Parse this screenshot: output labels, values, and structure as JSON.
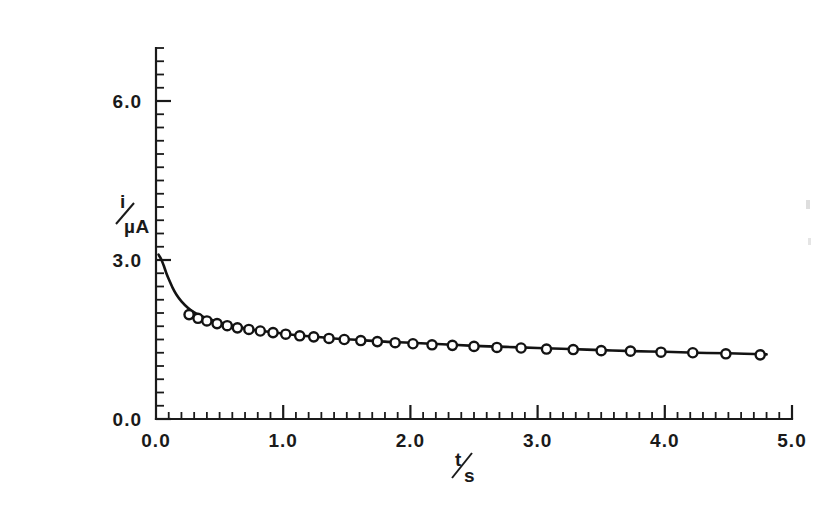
{
  "chart_data": {
    "type": "line",
    "title": "",
    "subtitle": "",
    "xlabel": "t/s",
    "ylabel": "i/µA",
    "xlim": [
      0.0,
      5.0
    ],
    "ylim": [
      0.0,
      7.0
    ],
    "grid": false,
    "legend_position": "none",
    "x_tick_labels": [
      "0.0",
      "1.0",
      "2.0",
      "3.0",
      "4.0",
      "5.0"
    ],
    "x_tick_values": [
      0.0,
      1.0,
      2.0,
      3.0,
      4.0,
      5.0
    ],
    "x_minor_tick_interval": 0.1,
    "y_tick_labels": [
      "0.0",
      "3.0",
      "6.0"
    ],
    "y_tick_values": [
      0.0,
      3.0,
      6.0
    ],
    "y_minor_tick_interval": 0.25,
    "series": [
      {
        "name": "theoretical-curve",
        "style": "solid-line",
        "x": [
          0.02,
          0.04,
          0.06,
          0.08,
          0.1,
          0.13,
          0.16,
          0.2,
          0.25,
          0.3,
          0.35,
          0.4,
          0.5,
          0.6,
          0.7,
          0.8,
          0.9,
          1.0,
          1.2,
          1.4,
          1.6,
          1.8,
          2.0,
          2.25,
          2.5,
          2.75,
          3.0,
          3.25,
          3.5,
          3.75,
          4.0,
          4.25,
          4.5,
          4.8
        ],
        "y": [
          3.1,
          3.02,
          2.9,
          2.76,
          2.64,
          2.48,
          2.35,
          2.22,
          2.1,
          2.01,
          1.95,
          1.9,
          1.82,
          1.76,
          1.71,
          1.67,
          1.64,
          1.61,
          1.56,
          1.52,
          1.49,
          1.46,
          1.44,
          1.41,
          1.38,
          1.36,
          1.34,
          1.32,
          1.3,
          1.28,
          1.27,
          1.25,
          1.24,
          1.22
        ]
      },
      {
        "name": "experimental-points",
        "style": "open-circles",
        "x": [
          0.26,
          0.33,
          0.4,
          0.48,
          0.56,
          0.64,
          0.73,
          0.82,
          0.92,
          1.02,
          1.13,
          1.24,
          1.36,
          1.48,
          1.61,
          1.74,
          1.88,
          2.02,
          2.17,
          2.33,
          2.5,
          2.68,
          2.87,
          3.07,
          3.28,
          3.5,
          3.73,
          3.97,
          4.22,
          4.48,
          4.75
        ],
        "y": [
          1.97,
          1.9,
          1.85,
          1.8,
          1.76,
          1.72,
          1.69,
          1.66,
          1.63,
          1.6,
          1.57,
          1.55,
          1.52,
          1.5,
          1.48,
          1.46,
          1.44,
          1.42,
          1.4,
          1.39,
          1.37,
          1.35,
          1.34,
          1.32,
          1.31,
          1.29,
          1.28,
          1.26,
          1.25,
          1.23,
          1.21
        ]
      }
    ],
    "colors": {
      "curve": "#131313",
      "marker_stroke": "#131313",
      "marker_fill": "#ffffff",
      "axis": "#1a1a1a",
      "background": "#ffffff"
    }
  },
  "axes": {
    "y_axis_label": "i/µA",
    "y_axis_label_numerator": "i",
    "y_axis_label_denominator": "µA",
    "x_axis_label": "t/s",
    "x_axis_label_numerator": "t",
    "x_axis_label_denominator": "s"
  }
}
